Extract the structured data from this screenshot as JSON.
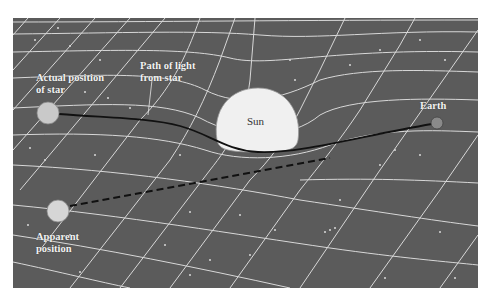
{
  "diagram": {
    "colors": {
      "background": "#5b5b5b",
      "grid": "#e6e6e6",
      "sun": "#f0f0f0",
      "star": "#c9c9c9",
      "earth": "#8a8a8a",
      "path": "#111111",
      "stars_dots": "#d8d8d8"
    },
    "labels": {
      "actual_position": "Actual position\nof star",
      "path_of_light": "Path of light\nfrom star",
      "sun": "Sun",
      "earth": "Earth",
      "apparent_position": "Apparent\nposition"
    }
  }
}
